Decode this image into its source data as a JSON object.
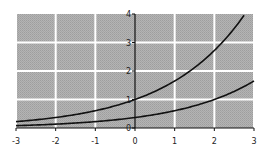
{
  "chart_data": {
    "type": "line",
    "title": "",
    "xlabel": "",
    "ylabel": "",
    "xlim": [
      -3,
      3
    ],
    "ylim": [
      0,
      4
    ],
    "grid": true,
    "legend": null,
    "x_ticks": [
      "-3",
      "-2",
      "-1",
      "0",
      "1",
      "2",
      "3"
    ],
    "y_ticks": [
      "0",
      "1",
      "2",
      "3",
      "4"
    ],
    "series": [
      {
        "name": "upper curve",
        "function": "e^(x/2)",
        "x": [
          -3,
          -2,
          -1,
          0,
          1,
          2,
          2.77
        ],
        "values": [
          0.22,
          0.37,
          0.61,
          1.0,
          1.65,
          2.72,
          4.0
        ]
      },
      {
        "name": "lower curve",
        "function": "e^((x-2)/2)",
        "x": [
          -3,
          -2,
          -1,
          0,
          1,
          2,
          3
        ],
        "values": [
          0.08,
          0.14,
          0.22,
          0.37,
          0.61,
          1.0,
          1.65
        ]
      }
    ],
    "colors": {
      "plot_background": "#ababab",
      "grid": "#ffffff",
      "curves": "#111111",
      "axis": "#111111"
    }
  }
}
